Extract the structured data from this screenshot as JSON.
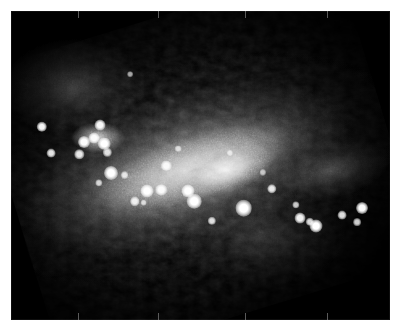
{
  "page": {
    "width": 401,
    "height": 333,
    "background_color": "#ffffff"
  },
  "frame": {
    "x": 11,
    "y": 11,
    "width": 379,
    "height": 309,
    "background_color": "#000000",
    "border_color": "#ffffff",
    "label": "Galaxy image frame"
  },
  "chart_data": {
    "type": "heatmap",
    "title": "",
    "subtitle": "",
    "xlabel": "",
    "ylabel": "",
    "colormap": "grayscale",
    "background_color": "#000000",
    "peak_color": "#ffffff",
    "galaxy_position_angle_deg": -18,
    "axis_ticks": {
      "grid": false,
      "tick_color": "#5a5a5a",
      "top_x_percent": [
        17.7,
        38.8,
        61.7,
        83.4
      ],
      "bottom_x_percent": [
        17.7,
        38.8,
        61.7,
        83.4
      ]
    },
    "components": [
      {
        "name": "outer-halo",
        "cx_percent": 47,
        "cy_percent": 50,
        "rx_percent": 58,
        "ry_percent": 34,
        "peak_intensity": 0.22
      },
      {
        "name": "mid-halo",
        "cx_percent": 46,
        "cy_percent": 50,
        "rx_percent": 46,
        "ry_percent": 24,
        "peak_intensity": 0.38
      },
      {
        "name": "luminous-bar",
        "cx_percent": 48,
        "cy_percent": 50,
        "rx_percent": 34,
        "ry_percent": 13,
        "peak_intensity": 0.72
      },
      {
        "name": "starburst-core",
        "cx_percent": 56,
        "cy_percent": 54,
        "rx_percent": 13,
        "ry_percent": 7.5,
        "peak_intensity": 0.92
      },
      {
        "name": "northwest-knot",
        "cx_percent": 23,
        "cy_percent": 41,
        "rx_percent": 7,
        "ry_percent": 5,
        "peak_intensity": 0.8
      },
      {
        "name": "northwest-plume",
        "cx_percent": 17,
        "cy_percent": 25,
        "rx_percent": 19,
        "ry_percent": 16,
        "peak_intensity": 0.26
      },
      {
        "name": "southeast-plume",
        "cx_percent": 66,
        "cy_percent": 73,
        "rx_percent": 22,
        "ry_percent": 16,
        "peak_intensity": 0.2
      },
      {
        "name": "east-extension",
        "cx_percent": 83,
        "cy_percent": 62,
        "rx_percent": 16,
        "ry_percent": 9,
        "peak_intensity": 0.28
      }
    ],
    "point_sources": [
      {
        "x_percent": 8.2,
        "y_percent": 37.5,
        "size_px": 4.0,
        "brightness": 0.95
      },
      {
        "x_percent": 10.5,
        "y_percent": 46.1,
        "size_px": 3.4,
        "brightness": 0.88
      },
      {
        "x_percent": 23.5,
        "y_percent": 36.8,
        "size_px": 4.2,
        "brightness": 0.96
      },
      {
        "x_percent": 19.2,
        "y_percent": 42.4,
        "size_px": 4.6,
        "brightness": 0.98
      },
      {
        "x_percent": 21.8,
        "y_percent": 41.1,
        "size_px": 4.2,
        "brightness": 0.95
      },
      {
        "x_percent": 24.6,
        "y_percent": 43.0,
        "size_px": 4.8,
        "brightness": 1.0
      },
      {
        "x_percent": 18.0,
        "y_percent": 46.4,
        "size_px": 3.6,
        "brightness": 0.9
      },
      {
        "x_percent": 25.4,
        "y_percent": 45.7,
        "size_px": 3.2,
        "brightness": 0.85
      },
      {
        "x_percent": 26.4,
        "y_percent": 52.5,
        "size_px": 5.4,
        "brightness": 1.0
      },
      {
        "x_percent": 30.0,
        "y_percent": 53.2,
        "size_px": 3.0,
        "brightness": 0.8
      },
      {
        "x_percent": 23.2,
        "y_percent": 55.6,
        "size_px": 2.8,
        "brightness": 0.76
      },
      {
        "x_percent": 36.0,
        "y_percent": 58.4,
        "size_px": 5.0,
        "brightness": 1.0
      },
      {
        "x_percent": 39.6,
        "y_percent": 57.8,
        "size_px": 4.4,
        "brightness": 0.96
      },
      {
        "x_percent": 32.6,
        "y_percent": 61.6,
        "size_px": 3.6,
        "brightness": 0.88
      },
      {
        "x_percent": 35.0,
        "y_percent": 62.0,
        "size_px": 2.6,
        "brightness": 0.72
      },
      {
        "x_percent": 41.0,
        "y_percent": 50.1,
        "size_px": 4.0,
        "brightness": 0.92
      },
      {
        "x_percent": 46.6,
        "y_percent": 58.2,
        "size_px": 5.0,
        "brightness": 1.0
      },
      {
        "x_percent": 48.4,
        "y_percent": 61.5,
        "size_px": 5.6,
        "brightness": 1.0
      },
      {
        "x_percent": 53.0,
        "y_percent": 67.8,
        "size_px": 3.2,
        "brightness": 0.84
      },
      {
        "x_percent": 61.4,
        "y_percent": 63.8,
        "size_px": 6.4,
        "brightness": 1.0
      },
      {
        "x_percent": 68.8,
        "y_percent": 57.6,
        "size_px": 3.6,
        "brightness": 0.88
      },
      {
        "x_percent": 75.2,
        "y_percent": 62.8,
        "size_px": 2.8,
        "brightness": 0.76
      },
      {
        "x_percent": 76.2,
        "y_percent": 67.0,
        "size_px": 4.2,
        "brightness": 0.94
      },
      {
        "x_percent": 78.8,
        "y_percent": 68.2,
        "size_px": 3.2,
        "brightness": 0.84
      },
      {
        "x_percent": 80.6,
        "y_percent": 69.7,
        "size_px": 5.0,
        "brightness": 1.0
      },
      {
        "x_percent": 87.4,
        "y_percent": 66.0,
        "size_px": 3.4,
        "brightness": 0.86
      },
      {
        "x_percent": 92.6,
        "y_percent": 63.8,
        "size_px": 4.6,
        "brightness": 0.98
      },
      {
        "x_percent": 91.4,
        "y_percent": 68.4,
        "size_px": 3.0,
        "brightness": 0.8
      },
      {
        "x_percent": 31.4,
        "y_percent": 20.5,
        "size_px": 2.2,
        "brightness": 0.62
      },
      {
        "x_percent": 57.8,
        "y_percent": 46.0,
        "size_px": 2.4,
        "brightness": 0.66
      },
      {
        "x_percent": 44.0,
        "y_percent": 44.5,
        "size_px": 2.6,
        "brightness": 0.7
      },
      {
        "x_percent": 66.4,
        "y_percent": 52.2,
        "size_px": 2.4,
        "brightness": 0.66
      }
    ]
  }
}
